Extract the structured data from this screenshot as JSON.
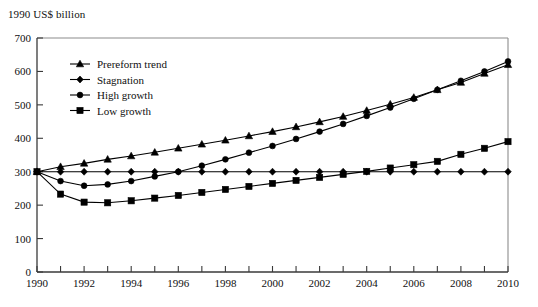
{
  "axis_title": "1990 US$ billion",
  "chart_data": {
    "type": "line",
    "title": "",
    "xlabel": "",
    "ylabel": "1990 US$ billion",
    "xlim": [
      1990,
      2010
    ],
    "ylim": [
      0,
      700
    ],
    "ytick_step": 100,
    "yticks": [
      0,
      100,
      200,
      300,
      400,
      500,
      600,
      700
    ],
    "xticks": [
      1990,
      1991,
      1992,
      1993,
      1994,
      1995,
      1996,
      1997,
      1998,
      1999,
      2000,
      2001,
      2002,
      2003,
      2004,
      2005,
      2006,
      2007,
      2008,
      2009,
      2010
    ],
    "xtick_labels": [
      "1990",
      "",
      "1992",
      "",
      "1994",
      "",
      "1996",
      "",
      "1998",
      "",
      "2000",
      "",
      "2002",
      "",
      "2004",
      "",
      "2006",
      "",
      "2008",
      "",
      "2010"
    ],
    "grid": false,
    "legend_position": "upper-left-inside",
    "x": [
      1990,
      1991,
      1992,
      1993,
      1994,
      1995,
      1996,
      1997,
      1998,
      1999,
      2000,
      2001,
      2002,
      2003,
      2004,
      2005,
      2006,
      2007,
      2008,
      2009,
      2010
    ],
    "series": [
      {
        "name": "Prereform trend",
        "marker": "triangle",
        "values": [
          300,
          315,
          325,
          337,
          347,
          358,
          370,
          382,
          394,
          407,
          420,
          434,
          449,
          465,
          483,
          502,
          522,
          545,
          567,
          594,
          620
        ]
      },
      {
        "name": "Stagnation",
        "marker": "diamond",
        "values": [
          300,
          300,
          300,
          300,
          300,
          300,
          300,
          300,
          300,
          300,
          300,
          300,
          300,
          300,
          300,
          300,
          300,
          300,
          300,
          300,
          300
        ]
      },
      {
        "name": "High growth",
        "marker": "circle",
        "values": [
          300,
          272,
          258,
          262,
          272,
          286,
          300,
          318,
          337,
          357,
          377,
          398,
          420,
          443,
          467,
          492,
          518,
          545,
          572,
          600,
          630
        ]
      },
      {
        "name": "Low growth",
        "marker": "square",
        "values": [
          300,
          233,
          209,
          207,
          213,
          221,
          229,
          238,
          247,
          256,
          265,
          274,
          283,
          292,
          301,
          311,
          321,
          331,
          352,
          370,
          390
        ]
      }
    ]
  },
  "legend": {
    "items": [
      {
        "label": "Prereform trend",
        "marker": "triangle"
      },
      {
        "label": "Stagnation",
        "marker": "diamond"
      },
      {
        "label": "High growth",
        "marker": "circle"
      },
      {
        "label": "Low growth",
        "marker": "square"
      }
    ]
  }
}
